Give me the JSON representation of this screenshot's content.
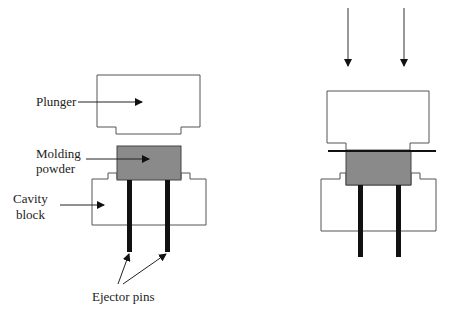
{
  "labels": {
    "plunger": "Plunger",
    "molding_powder_line1": "Molding",
    "molding_powder_line2": "powder",
    "cavity_block_line1": "Cavity",
    "cavity_block_line2": "block",
    "ejector_pins": "Ejector pins"
  },
  "colors": {
    "outline": "#555555",
    "powder_fill": "#8a8a8a",
    "pin": "#111111",
    "arrow": "#222222"
  },
  "stages": [
    {
      "name": "before-compression",
      "components": [
        "plunger",
        "molding-powder",
        "cavity-block",
        "ejector-pins"
      ]
    },
    {
      "name": "during-compression",
      "components": [
        "force-arrows",
        "plunger",
        "molding-powder",
        "cavity-block",
        "ejector-pins"
      ]
    }
  ]
}
